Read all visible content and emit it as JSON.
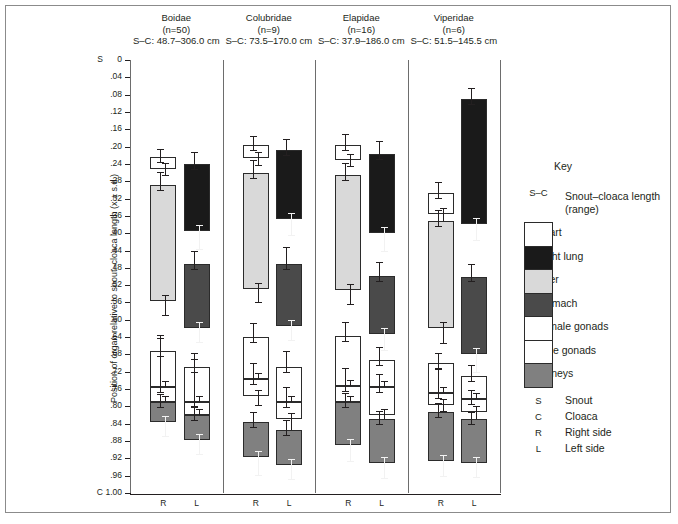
{
  "figure": {
    "y_axis_title": "Position of organ relative to snout–cloaca length (x ± s.d.)",
    "y_top_marker": "S",
    "y_bottom_marker": "C",
    "y_ticks": [
      "0",
      ".04",
      ".08",
      ".12",
      ".16",
      ".20",
      ".24",
      ".28",
      ".32",
      ".36",
      ".40",
      ".44",
      ".48",
      ".52",
      ".56",
      ".60",
      ".64",
      ".68",
      ".72",
      ".76",
      ".80",
      ".84",
      ".88",
      ".92",
      ".96",
      "1.00"
    ],
    "side_labels": [
      "R",
      "L"
    ]
  },
  "key": {
    "title": "Key",
    "entries": [
      {
        "icon": "sc-range-label",
        "swatch": "S–C",
        "label": "Snout–cloaca length (range)"
      },
      {
        "icon": "heart-swatch",
        "swatch": "",
        "label": "Heart"
      },
      {
        "icon": "right-lung-swatch",
        "swatch": "",
        "label": "Right lung"
      },
      {
        "icon": "liver-swatch",
        "swatch": "",
        "label": "Liver"
      },
      {
        "icon": "stomach-swatch",
        "swatch": "",
        "label": "Stomach"
      },
      {
        "icon": "female-gonads-swatch",
        "swatch": "",
        "label": "Female gonads"
      },
      {
        "icon": "male-gonads-swatch",
        "swatch": "",
        "label": "Male gonads"
      },
      {
        "icon": "kidneys-swatch",
        "swatch": "",
        "label": "Kidneys"
      }
    ],
    "letters": [
      {
        "letter": "S",
        "label": "Snout"
      },
      {
        "letter": "C",
        "label": "Cloaca"
      },
      {
        "letter": "R",
        "label": "Right side"
      },
      {
        "letter": "L",
        "label": "Left side"
      }
    ]
  },
  "colors": {
    "heart": "#ffffff",
    "right_lung": "#1a1a1a",
    "liver": "#d9d9d9",
    "stomach": "#4a4a4a",
    "female_gonads": "#ffffff",
    "male_gonads": "#ffffff",
    "kidneys": "#808080",
    "outline": "#2b2b2b",
    "axis": "#231f20"
  },
  "chart_data": {
    "type": "bar",
    "title": "",
    "xlabel": "",
    "ylabel": "Position of organ relative to snout–cloaca length (x ± s.d.)",
    "ylim": [
      0,
      1.0
    ],
    "y_inverted": true,
    "grid": false,
    "legend_position": "right",
    "groups": [
      {
        "name": "Boidae",
        "n_label": "(n=50)",
        "n": 50,
        "sc_label": "S–C: 48.7–306.0 cm",
        "sc_range_cm": [
          48.7,
          306.0
        ],
        "columns": [
          {
            "side": "R",
            "segments": [
              {
                "organ": "Heart",
                "start": 0.224,
                "end": 0.252,
                "err_start": 0.206,
                "err_end": 0.268
              },
              {
                "organ": "Liver",
                "start": 0.288,
                "end": 0.556,
                "err_start": 0.258,
                "err_end": 0.592
              },
              {
                "organ": "Female gonads",
                "start": 0.672,
                "end": 0.756,
                "err_start": 0.636,
                "err_end": 0.784
              },
              {
                "organ": "Male gonads",
                "start": 0.756,
                "end": 0.79,
                "err_start": 0.642,
                "err_end": 0.8
              },
              {
                "organ": "Kidneys",
                "start": 0.79,
                "end": 0.836,
                "err_start": 0.772,
                "err_end": 0.87
              }
            ]
          },
          {
            "side": "L",
            "segments": [
              {
                "organ": "Right lung",
                "start": 0.24,
                "end": 0.396,
                "err_start": 0.212,
                "err_end": 0.438
              },
              {
                "organ": "Stomach",
                "start": 0.47,
                "end": 0.618,
                "err_start": 0.44,
                "err_end": 0.654
              },
              {
                "organ": "Female gonads",
                "start": 0.71,
                "end": 0.79,
                "err_start": 0.676,
                "err_end": 0.812
              },
              {
                "organ": "Male gonads",
                "start": 0.79,
                "end": 0.82,
                "err_start": 0.69,
                "err_end": 0.828
              },
              {
                "organ": "Kidneys",
                "start": 0.82,
                "end": 0.878,
                "err_start": 0.8,
                "err_end": 0.912
              }
            ]
          }
        ]
      },
      {
        "name": "Colubridae",
        "n_label": "(n=9)",
        "n": 9,
        "sc_label": "S–C: 73.5–170.0 cm",
        "sc_range_cm": [
          73.5,
          170.0
        ],
        "columns": [
          {
            "side": "R",
            "segments": [
              {
                "organ": "Heart",
                "start": 0.196,
                "end": 0.226,
                "err_start": 0.176,
                "err_end": 0.244
              },
              {
                "organ": "Liver",
                "start": 0.262,
                "end": 0.53,
                "err_start": 0.232,
                "err_end": 0.562
              },
              {
                "organ": "Female gonads",
                "start": 0.64,
                "end": 0.736,
                "err_start": 0.608,
                "err_end": 0.766
              },
              {
                "organ": "Male gonads",
                "start": 0.736,
                "end": 0.776,
                "err_start": 0.7,
                "err_end": 0.8
              },
              {
                "organ": "Kidneys",
                "start": 0.836,
                "end": 0.916,
                "err_start": 0.812,
                "err_end": 0.96
              }
            ]
          },
          {
            "side": "L",
            "segments": [
              {
                "organ": "Right lung",
                "start": 0.208,
                "end": 0.368,
                "err_start": 0.182,
                "err_end": 0.406
              },
              {
                "organ": "Stomach",
                "start": 0.472,
                "end": 0.614,
                "err_start": 0.432,
                "err_end": 0.648
              },
              {
                "organ": "Female gonads",
                "start": 0.708,
                "end": 0.79,
                "err_start": 0.672,
                "err_end": 0.812
              },
              {
                "organ": "Male gonads",
                "start": 0.79,
                "end": 0.83,
                "err_start": 0.756,
                "err_end": 0.858
              },
              {
                "organ": "Kidneys",
                "start": 0.854,
                "end": 0.936,
                "err_start": 0.832,
                "err_end": 0.97
              }
            ]
          }
        ]
      },
      {
        "name": "Elapidae",
        "n_label": "(n=16)",
        "n": 16,
        "sc_label": "S–C: 37.9–186.0 cm",
        "sc_range_cm": [
          37.9,
          186.0
        ],
        "columns": [
          {
            "side": "R",
            "segments": [
              {
                "organ": "Heart",
                "start": 0.196,
                "end": 0.23,
                "err_start": 0.172,
                "err_end": 0.248
              },
              {
                "organ": "Liver",
                "start": 0.266,
                "end": 0.532,
                "err_start": 0.238,
                "err_end": 0.566
              },
              {
                "organ": "Female gonads",
                "start": 0.638,
                "end": 0.752,
                "err_start": 0.604,
                "err_end": 0.782
              },
              {
                "organ": "Male gonads",
                "start": 0.752,
                "end": 0.79,
                "err_start": 0.712,
                "err_end": 0.81
              },
              {
                "organ": "Kidneys",
                "start": 0.79,
                "end": 0.89,
                "err_start": 0.77,
                "err_end": 0.928
              }
            ]
          },
          {
            "side": "L",
            "segments": [
              {
                "organ": "Right lung",
                "start": 0.216,
                "end": 0.4,
                "err_start": 0.188,
                "err_end": 0.444
              },
              {
                "organ": "Stomach",
                "start": 0.498,
                "end": 0.632,
                "err_start": 0.466,
                "err_end": 0.672
              },
              {
                "organ": "Female gonads",
                "start": 0.692,
                "end": 0.756,
                "err_start": 0.662,
                "err_end": 0.786
              },
              {
                "organ": "Male gonads",
                "start": 0.756,
                "end": 0.82,
                "err_start": 0.726,
                "err_end": 0.846
              },
              {
                "organ": "Kidneys",
                "start": 0.828,
                "end": 0.93,
                "err_start": 0.81,
                "err_end": 0.968
              }
            ]
          }
        ]
      },
      {
        "name": "Viperidae",
        "n_label": "(n=6)",
        "n": 6,
        "sc_label": "S–C: 51.5–145.5 cm",
        "sc_range_cm": [
          51.5,
          145.5
        ],
        "columns": [
          {
            "side": "R",
            "segments": [
              {
                "organ": "Heart",
                "start": 0.308,
                "end": 0.356,
                "err_start": 0.282,
                "err_end": 0.38
              },
              {
                "organ": "Liver",
                "start": 0.372,
                "end": 0.62,
                "err_start": 0.346,
                "err_end": 0.656
              },
              {
                "organ": "Female gonads",
                "start": 0.7,
                "end": 0.768,
                "err_start": 0.676,
                "err_end": 0.79
              },
              {
                "organ": "Male gonads",
                "start": 0.768,
                "end": 0.796,
                "err_start": 0.714,
                "err_end": 0.812
              },
              {
                "organ": "Kidneys",
                "start": 0.812,
                "end": 0.926,
                "err_start": 0.792,
                "err_end": 0.962
              }
            ]
          },
          {
            "side": "L",
            "segments": [
              {
                "organ": "Right lung",
                "start": 0.09,
                "end": 0.378,
                "err_start": 0.064,
                "err_end": 0.418
              },
              {
                "organ": "Stomach",
                "start": 0.5,
                "end": 0.68,
                "err_start": 0.47,
                "err_end": 0.722
              },
              {
                "organ": "Female gonads",
                "start": 0.73,
                "end": 0.784,
                "err_start": 0.704,
                "err_end": 0.804
              },
              {
                "organ": "Male gonads",
                "start": 0.784,
                "end": 0.812,
                "err_start": 0.762,
                "err_end": 0.834
              },
              {
                "organ": "Kidneys",
                "start": 0.83,
                "end": 0.93,
                "err_start": 0.812,
                "err_end": 0.966
              }
            ]
          }
        ]
      }
    ]
  }
}
